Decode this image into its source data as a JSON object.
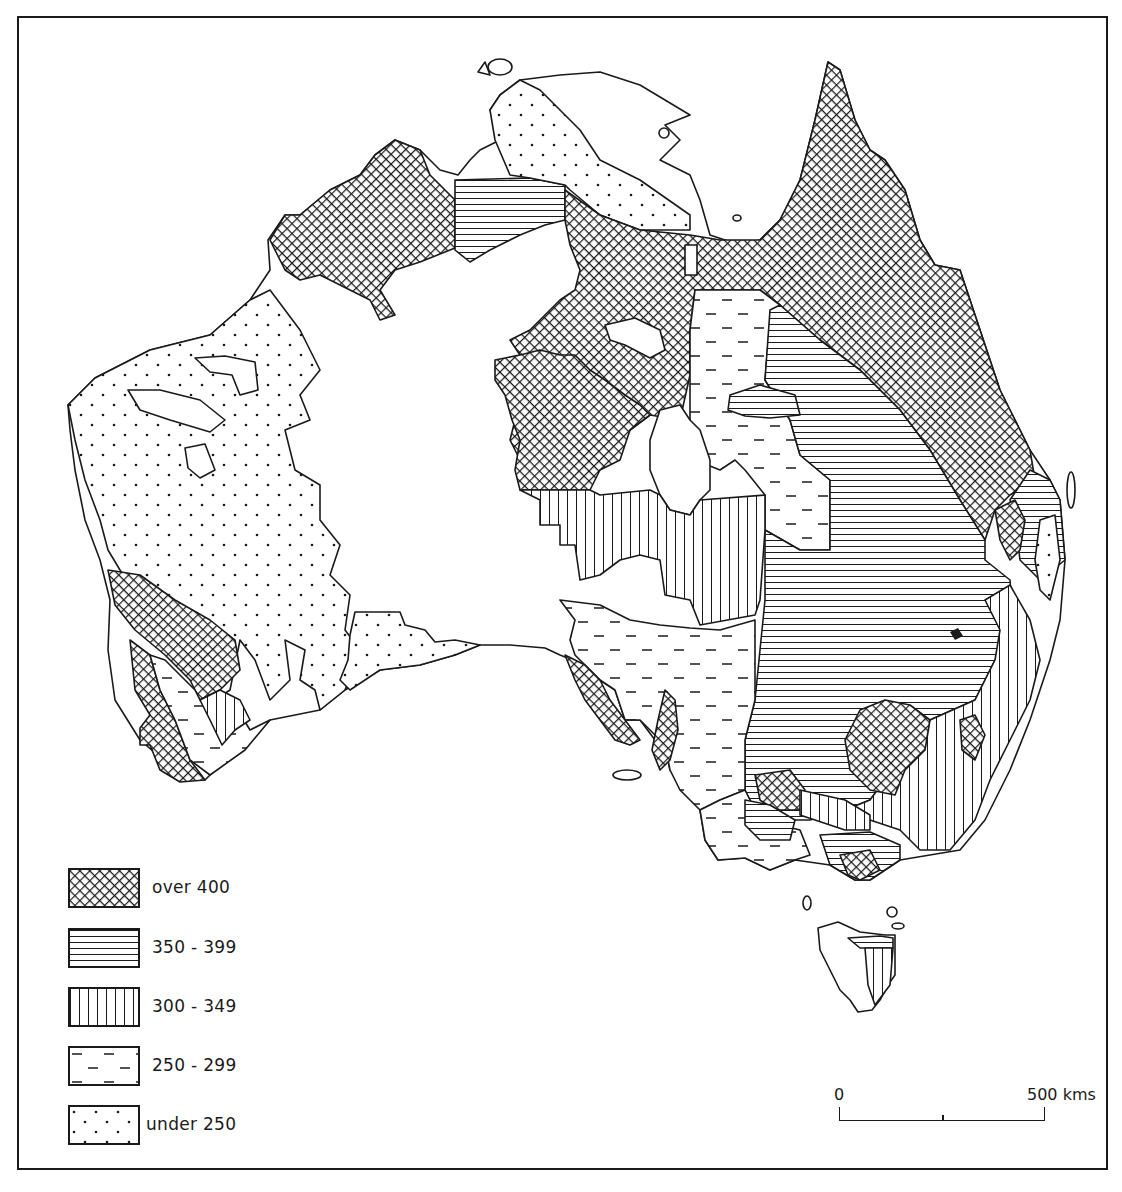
{
  "map": {
    "subject": "Australia",
    "colors": {
      "ink": "#1a1a1a",
      "paper": "#ffffff"
    }
  },
  "legend": {
    "items": [
      {
        "label": "over 400",
        "pattern": "crosshatch"
      },
      {
        "label": "350 - 399",
        "pattern": "horizontal-lines"
      },
      {
        "label": "300 - 349",
        "pattern": "vertical-lines"
      },
      {
        "label": "250 - 299",
        "pattern": "dashes"
      },
      {
        "label": "under 250",
        "pattern": "dots"
      }
    ]
  },
  "scale": {
    "start_label": "0",
    "end_label": "500 kms",
    "mid_tick": true
  }
}
